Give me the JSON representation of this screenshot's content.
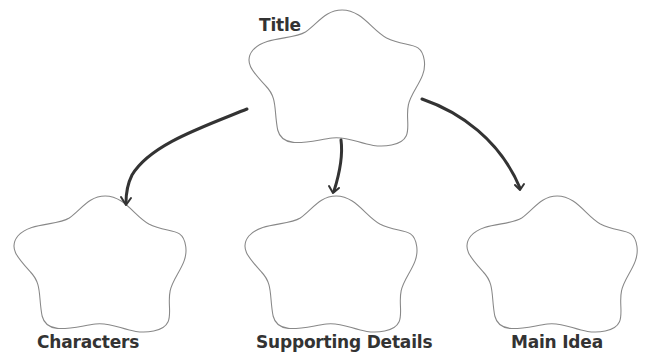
{
  "diagram": {
    "type": "graphic-organizer",
    "colors": {
      "outline": "#888888",
      "arrow": "#333333",
      "text": "#333333",
      "background": "#ffffff"
    },
    "nodes": [
      {
        "id": "title",
        "label": "Title"
      },
      {
        "id": "characters",
        "label": "Characters"
      },
      {
        "id": "supporting-details",
        "label": "Supporting Details"
      },
      {
        "id": "main-idea",
        "label": "Main Idea"
      }
    ],
    "edges": [
      {
        "from": "title",
        "to": "characters"
      },
      {
        "from": "title",
        "to": "supporting-details"
      },
      {
        "from": "title",
        "to": "main-idea"
      }
    ]
  }
}
